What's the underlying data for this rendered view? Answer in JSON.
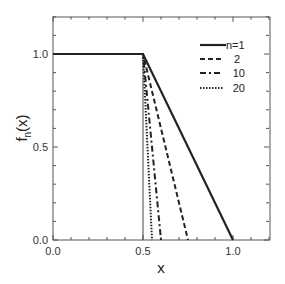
{
  "chart_data": {
    "type": "line",
    "title": "",
    "xlabel": "x",
    "ylabel": "f_n(x)",
    "ylabel_main": "f",
    "ylabel_sub": "n",
    "ylabel_tail": "(x)",
    "xlim": [
      0.0,
      1.2
    ],
    "ylim": [
      0.0,
      1.2
    ],
    "grid": false,
    "legend_position": "upper right",
    "x_ticks": [
      0.0,
      0.5,
      1.0
    ],
    "x_tick_labels": [
      "0.0",
      "0.5",
      "1.0"
    ],
    "y_ticks": [
      0.0,
      0.5,
      1.0
    ],
    "y_tick_labels": [
      "0.0",
      "0.5",
      "1.0"
    ],
    "minor_tick_step": 0.1,
    "series": [
      {
        "name": "n=1",
        "legend_label": "n=1",
        "style": "solid",
        "x": [
          0.0,
          0.5,
          1.0
        ],
        "y": [
          1.0,
          1.0,
          0.0
        ]
      },
      {
        "name": "n=2",
        "legend_label": "2",
        "style": "dashed",
        "x": [
          0.0,
          0.5,
          0.75
        ],
        "y": [
          1.0,
          1.0,
          0.0
        ]
      },
      {
        "name": "n=10",
        "legend_label": "10",
        "style": "dashdot",
        "x": [
          0.0,
          0.5,
          0.6
        ],
        "y": [
          1.0,
          1.0,
          0.0
        ]
      },
      {
        "name": "n=20",
        "legend_label": "20",
        "style": "dotted",
        "x": [
          0.0,
          0.5,
          0.55
        ],
        "y": [
          1.0,
          1.0,
          0.0
        ]
      }
    ],
    "annotations": [
      {
        "type": "vertical-line",
        "x": 0.5,
        "y_range": [
          0.0,
          1.0
        ],
        "style": "thin solid"
      }
    ]
  }
}
